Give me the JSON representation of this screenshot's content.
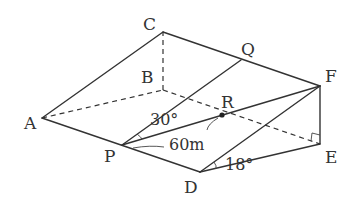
{
  "diagram": {
    "type": "geometry-3d-triangular-prism",
    "points": {
      "A": {
        "label": "A",
        "x": 42,
        "y": 118
      },
      "B": {
        "label": "B",
        "x": 163,
        "y": 90
      },
      "C": {
        "label": "C",
        "x": 163,
        "y": 32
      },
      "D": {
        "label": "D",
        "x": 200,
        "y": 172
      },
      "E": {
        "label": "E",
        "x": 320,
        "y": 144
      },
      "F": {
        "label": "F",
        "x": 320,
        "y": 86
      },
      "P": {
        "label": "P",
        "x": 122,
        "y": 145
      },
      "Q": {
        "label": "Q",
        "x": 241,
        "y": 60
      },
      "R": {
        "label": "R",
        "x": 222,
        "y": 115
      }
    },
    "annotations": {
      "angle_QPR": "30°",
      "length_PR": "60m",
      "angle_EDF": "18°",
      "right_angle_at": "E"
    }
  }
}
